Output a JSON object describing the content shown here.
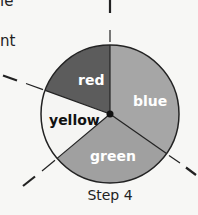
{
  "text_fragments": [
    "le",
    "nt"
  ],
  "diagram": {
    "type": "pie-spinner",
    "caption": "Step 4",
    "sections": [
      {
        "label": "red",
        "color": "#5c5c5c",
        "text_color": "#ffffff"
      },
      {
        "label": "blue",
        "color": "#a6a6a6",
        "text_color": "#ffffff"
      },
      {
        "label": "green",
        "color": "#a0a0a0",
        "text_color": "#ffffff"
      },
      {
        "label": "yellow",
        "color": "#f5f5f3",
        "text_color": "#111111"
      }
    ]
  }
}
